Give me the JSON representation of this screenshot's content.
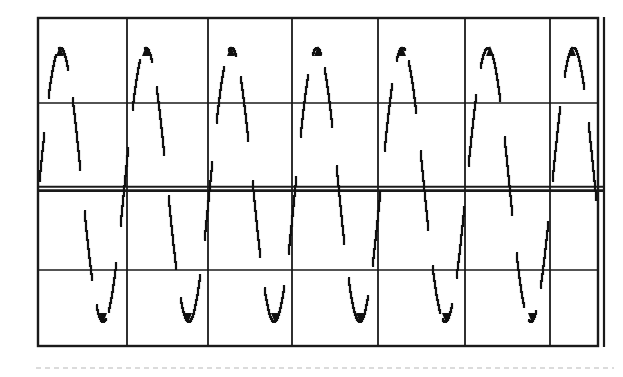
{
  "image": {
    "kind": "oscilloscope-screen-photo",
    "description": "Scanned black-and-white oscilloscope screen showing a continuous sine wave over a graticule",
    "background_color": "#ffffff",
    "trace_color": "#101010",
    "graticule_color": "#1a1a1a",
    "width": 623,
    "height": 377
  },
  "graticule": {
    "left": 38,
    "top": 18,
    "right": 598,
    "bottom": 346,
    "horizontal_divisions": 6,
    "vertical_divisions": 4,
    "border_width": 2.4,
    "inner_line_width": 1.3,
    "center_line_width": 3.2,
    "vertical_gridlines": [
      38,
      127,
      208,
      292,
      378,
      465,
      550,
      598
    ],
    "horizontal_gridlines": [
      18,
      103,
      189,
      270,
      346
    ],
    "center_line_y": 189,
    "double_right_edge_x": 604,
    "center_line_is_doubled": true
  },
  "waveform": {
    "type": "sine",
    "cycles_visible": 6.5,
    "peak_y": 47,
    "trough_y": 322,
    "center_y": 185,
    "amplitude_px": 137,
    "period_px": 85.5,
    "first_peak_x": 60,
    "phase_offset_px": 60,
    "peak_x_positions": [
      60,
      146,
      231,
      318,
      402,
      490,
      572
    ],
    "trough_x_positions": [
      103,
      188,
      275,
      360,
      446,
      532
    ],
    "amplitude_divisions": 3.35,
    "period_divisions": 0.92,
    "stroke_width": 2.2,
    "render_style": "stepped-sampled-dashed",
    "dash_threshold_slope": 2.6,
    "step_quantization_px": 3.5
  },
  "scan_artifacts": {
    "bottom_dotted_line_y": 368,
    "bottom_dotted_line_x_start": 36,
    "bottom_dotted_line_x_end": 614,
    "bottom_dotted_color": "#cfcfcf",
    "faint_top_smudge_color": "#f2f2f2"
  },
  "chart_data": {
    "type": "line",
    "title": "",
    "xlabel": "",
    "ylabel": "",
    "series": [
      {
        "name": "sine-trace",
        "function": "y = A * sin(2*pi*(x - x0)/T)",
        "amplitude": 3.35,
        "period_divisions": 0.92,
        "unit_x": "division",
        "unit_y": "division",
        "values_peaks": [
          3.35,
          3.35,
          3.35,
          3.35,
          3.35,
          3.35,
          3.35
        ],
        "values_troughs": [
          -3.35,
          -3.35,
          -3.35,
          -3.35,
          -3.35,
          -3.35
        ]
      }
    ],
    "xlim": [
      0,
      6
    ],
    "ylim": [
      -4,
      4
    ],
    "grid": true,
    "legend": "none"
  }
}
